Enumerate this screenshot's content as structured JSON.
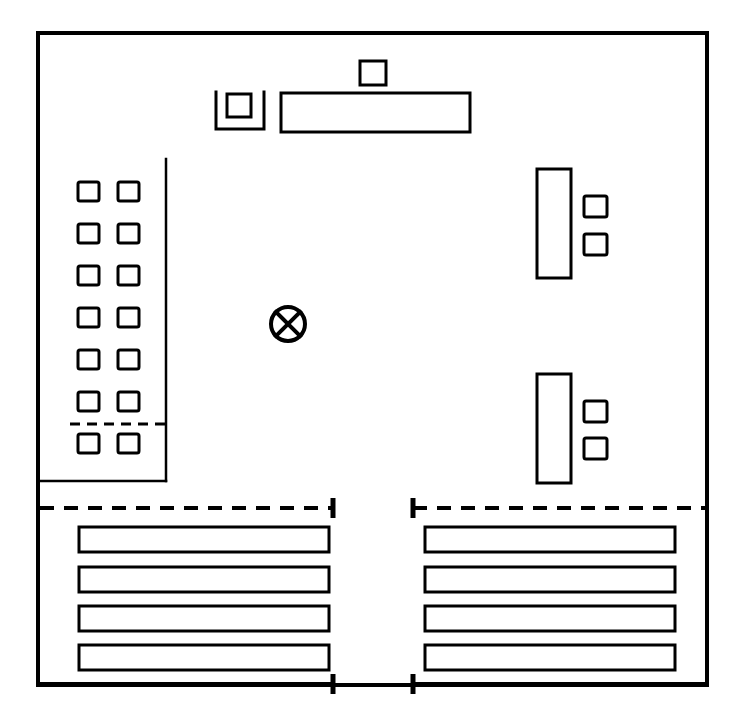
{
  "document": {
    "title": "Equipment Layout Plan",
    "type": "technical-line-drawing",
    "canvas": {
      "width": 742,
      "height": 715
    },
    "background_color": "#ffffff",
    "line_color": "#000000"
  },
  "frame": {
    "name": "outer-boundary-wall",
    "x": 38,
    "y": 33,
    "width": 669,
    "height": 652,
    "stroke_width": 4
  },
  "top_assembly": {
    "label": "top-equipment-group",
    "isolated_square": {
      "name": "small-square-top",
      "x": 360,
      "y": 61,
      "width": 26,
      "height": 24
    },
    "bracket_unit": {
      "name": "u-bracket-with-square",
      "bracket": {
        "x": 216,
        "y": 92,
        "width": 48,
        "height": 37
      },
      "inner_square": {
        "x": 227,
        "y": 94,
        "width": 24,
        "height": 23
      }
    },
    "long_bar": {
      "name": "horizontal-long-bar-top",
      "x": 281,
      "y": 93,
      "width": 189,
      "height": 39
    }
  },
  "left_module": {
    "label": "left-cell-array-module",
    "enclosure": {
      "name": "module-enclosure",
      "left": 38,
      "right": 166,
      "top": 159,
      "bottom": 481
    },
    "divider_line": {
      "name": "vertical-divider-line",
      "x": 166,
      "y_top": 159,
      "y_bottom": 481
    },
    "bottom_edge": {
      "name": "module-bottom-edge",
      "x_from": 38,
      "x_to": 166,
      "y": 481
    },
    "grid": {
      "name": "cell-grid",
      "rows": 7,
      "columns": 2,
      "cell_width": 21,
      "cell_height": 19,
      "column_x": [
        78,
        118
      ],
      "row_y": [
        182,
        224,
        266,
        308,
        350,
        392,
        434
      ]
    },
    "separator": {
      "name": "grid-row-separator-dashed",
      "x_from": 70,
      "x_to": 166,
      "y": 424,
      "style": "dashed"
    }
  },
  "center_marker": {
    "name": "center-reference-mark",
    "symbol": "circle-with-x",
    "cx": 288,
    "cy": 324,
    "radius": 17
  },
  "right_modules": [
    {
      "label": "upper-right-equipment-group",
      "tall_rect": {
        "name": "vertical-tall-rect",
        "x": 537,
        "y": 169,
        "width": 34,
        "height": 109
      },
      "squares": [
        {
          "name": "small-square-a",
          "x": 584,
          "y": 196,
          "width": 23,
          "height": 21
        },
        {
          "name": "small-square-b",
          "x": 584,
          "y": 234,
          "width": 23,
          "height": 21
        }
      ]
    },
    {
      "label": "lower-right-equipment-group",
      "tall_rect": {
        "name": "vertical-tall-rect",
        "x": 537,
        "y": 374,
        "width": 34,
        "height": 109
      },
      "squares": [
        {
          "name": "small-square-a",
          "x": 584,
          "y": 401,
          "width": 23,
          "height": 21
        },
        {
          "name": "small-square-b",
          "x": 584,
          "y": 438,
          "width": 23,
          "height": 21
        }
      ]
    }
  ],
  "dimension_guides": {
    "upper": {
      "label": "upper-dashed-dimension-guides",
      "y": 508,
      "left_segment": {
        "name": "dashed-guide-left",
        "x_from": 40,
        "x_to": 333,
        "tick_at": "end"
      },
      "right_segment": {
        "name": "dashed-guide-right",
        "x_from": 413,
        "x_to": 706,
        "tick_at": "start"
      },
      "tick_half_height": 10,
      "style": "dashed"
    },
    "lower": {
      "label": "lower-solid-dimension-lines",
      "y": 684,
      "left_segment": {
        "name": "dimension-line-left",
        "x_from": 38,
        "x_to": 333,
        "tick_at": "end"
      },
      "right_segment": {
        "name": "dimension-line-right",
        "x_from": 413,
        "x_to": 707,
        "tick_at": "start"
      },
      "tick_half_height": 10,
      "style": "solid"
    }
  },
  "bottom_bar_groups": [
    {
      "label": "bottom-left-bar-stack",
      "name": "bar-stack-left",
      "x": 79,
      "width": 250,
      "bar_height": 25,
      "bars": [
        {
          "name": "horizontal-bar",
          "y": 527
        },
        {
          "name": "horizontal-bar",
          "y": 567
        },
        {
          "name": "horizontal-bar",
          "y": 606
        },
        {
          "name": "horizontal-bar",
          "y": 645
        }
      ]
    },
    {
      "label": "bottom-right-bar-stack",
      "name": "bar-stack-right",
      "x": 425,
      "width": 250,
      "bar_height": 25,
      "bars": [
        {
          "name": "horizontal-bar",
          "y": 527
        },
        {
          "name": "horizontal-bar",
          "y": 567
        },
        {
          "name": "horizontal-bar",
          "y": 606
        },
        {
          "name": "horizontal-bar",
          "y": 645
        }
      ]
    }
  ]
}
